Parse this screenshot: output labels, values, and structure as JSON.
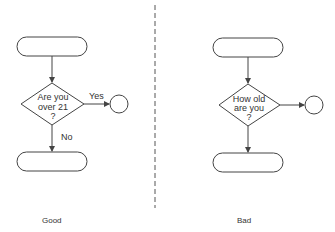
{
  "good": {
    "decision_line1": "Are you",
    "decision_line2": "over 21",
    "decision_line3": "?",
    "yes_label": "Yes",
    "no_label": "No",
    "caption": "Good"
  },
  "bad": {
    "decision_line1": "How old",
    "decision_line2": "are you",
    "decision_line3": "?",
    "caption": "Bad"
  },
  "colors": {
    "stroke": "#444444",
    "text": "#333333",
    "divider": "#555555"
  }
}
